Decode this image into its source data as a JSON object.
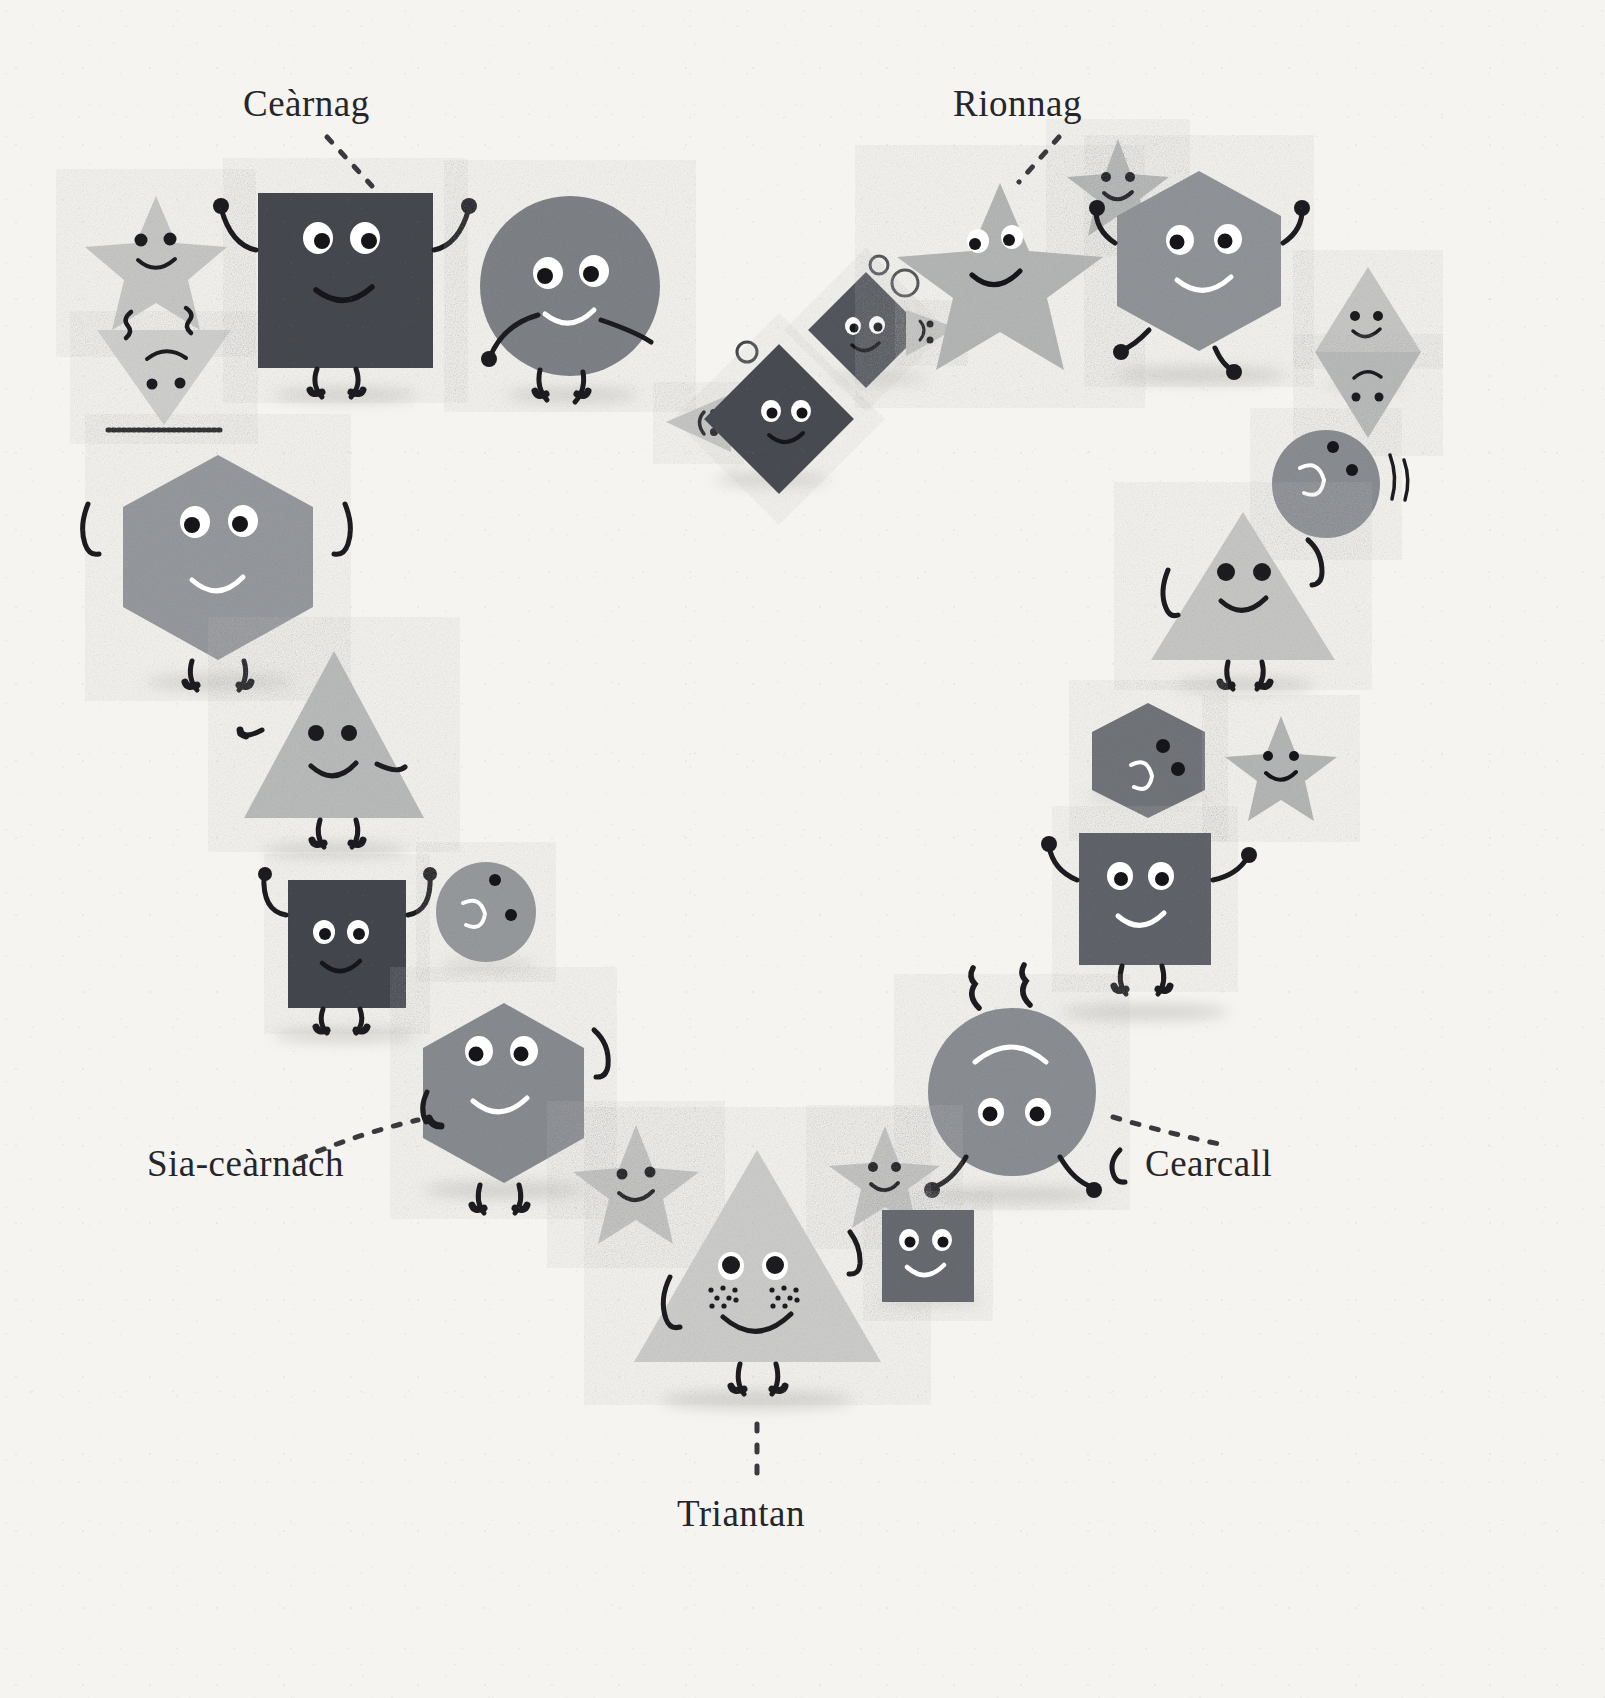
{
  "page": {
    "background_color": "#f5f4f0",
    "language": "Scottish Gaelic"
  },
  "labels": [
    {
      "id": "cearnag",
      "text": "Ceàrnag",
      "meaning": "square",
      "x": 243,
      "y": 82,
      "leader": "dashed-diagonal"
    },
    {
      "id": "rionnag",
      "text": "Rionnag",
      "meaning": "star",
      "x": 953,
      "y": 82,
      "leader": "dashed-diagonal"
    },
    {
      "id": "sia",
      "text": "Sia-ceàrnach",
      "meaning": "hexagon",
      "x": 147,
      "y": 1142,
      "leader": "dashed-diagonal"
    },
    {
      "id": "cearcall",
      "text": "Cearcall",
      "meaning": "circle",
      "x": 1145,
      "y": 1142,
      "leader": "dashed-diagonal"
    },
    {
      "id": "triantan",
      "text": "Triantan",
      "meaning": "triangle",
      "x": 677,
      "y": 1492,
      "leader": "dashed-vertical"
    }
  ],
  "palette": {
    "paper": "#f5f4f0",
    "charcoal": "#3f4147",
    "dark_slate": "#4a4d54",
    "mid_grey": "#8e9197",
    "grey": "#a2a5a9",
    "light_grey": "#bfc1c2",
    "pale_grey": "#d3d4d2",
    "ink": "#1c1c20",
    "eye_white": "#ffffff"
  },
  "characters": [
    {
      "name": "star-small-topleft",
      "shape": "star",
      "color": "#c9cac8",
      "expression": "smile"
    },
    {
      "name": "triangle-down-topleft",
      "shape": "triangle",
      "color": "#d2d3d1",
      "expression": "frown",
      "orientation": "down"
    },
    {
      "name": "square-cearnag",
      "shape": "square",
      "color": "#474a51",
      "expression": "smile",
      "arms": true,
      "legs": true
    },
    {
      "name": "circle-top",
      "shape": "circle",
      "color": "#808389",
      "expression": "smile",
      "arms": true,
      "legs": true
    },
    {
      "name": "triangle-left-bubbles",
      "shape": "triangle",
      "color": "#c9cac8",
      "expression": "smile",
      "orientation": "left"
    },
    {
      "name": "diamond-lower",
      "shape": "square",
      "color": "#4a4d54",
      "expression": "smile",
      "orientation": "rotated-45"
    },
    {
      "name": "diamond-upper",
      "shape": "square",
      "color": "#55585f",
      "expression": "smile",
      "orientation": "rotated-45"
    },
    {
      "name": "triangle-right-small",
      "shape": "triangle",
      "color": "#c9cac8",
      "expression": "smile",
      "orientation": "right"
    },
    {
      "name": "bubbles",
      "shape": "circles-outline",
      "color": "#44464b",
      "count": 6
    },
    {
      "name": "star-big-rionnag",
      "shape": "star",
      "color": "#b7b9b8",
      "expression": "smile"
    },
    {
      "name": "star-small-rionnag",
      "shape": "star",
      "color": "#b7b9b8",
      "expression": "smile"
    },
    {
      "name": "hexagon-topright",
      "shape": "hexagon",
      "color": "#93969a",
      "expression": "smile",
      "arms": true,
      "legs": true
    },
    {
      "name": "triangle-up-right-pair",
      "shape": "triangle",
      "color": "#c9cac8",
      "expression": "smile",
      "orientation": "up"
    },
    {
      "name": "triangle-down-right-pair",
      "shape": "triangle",
      "color": "#bbbdbc",
      "expression": "frown",
      "orientation": "down"
    },
    {
      "name": "circle-small-right",
      "shape": "circle",
      "color": "#8c8f94",
      "expression": "sideways"
    },
    {
      "name": "hexagon-left-big",
      "shape": "hexagon",
      "color": "#989b9f",
      "expression": "smile",
      "arms": true,
      "legs": true
    },
    {
      "name": "triangle-big-right",
      "shape": "triangle",
      "color": "#c9cac8",
      "expression": "smile",
      "arms": true,
      "legs": true
    },
    {
      "name": "triangle-left-mid",
      "shape": "triangle",
      "color": "#bcbebd",
      "expression": "smile",
      "arms": true,
      "legs": true
    },
    {
      "name": "hexagon-small-right",
      "shape": "hexagon",
      "color": "#73767c",
      "expression": "sideways"
    },
    {
      "name": "star-right-mid",
      "shape": "star",
      "color": "#b7b9b8",
      "expression": "smile"
    },
    {
      "name": "square-left-mid",
      "shape": "square",
      "color": "#45484f",
      "expression": "smile",
      "arms": true,
      "legs": true
    },
    {
      "name": "circle-small-left",
      "shape": "circle",
      "color": "#999c9f",
      "expression": "sideways"
    },
    {
      "name": "square-right-big",
      "shape": "square",
      "color": "#62656b",
      "expression": "smile",
      "arms": true,
      "legs": true
    },
    {
      "name": "hexagon-sia-cearnach",
      "shape": "hexagon",
      "color": "#8a8d92",
      "expression": "smile",
      "arms": true,
      "legs": true
    },
    {
      "name": "circle-cearcall",
      "shape": "circle",
      "color": "#8d9095",
      "expression": "upside-down",
      "arms": true,
      "legs": true
    },
    {
      "name": "star-bottom-left",
      "shape": "star",
      "color": "#c5c6c4",
      "expression": "smile"
    },
    {
      "name": "star-bottom-right",
      "shape": "star",
      "color": "#c5c6c4",
      "expression": "smile"
    },
    {
      "name": "triangle-triantan",
      "shape": "triangle",
      "color": "#cfd0ce",
      "expression": "smile-freckles",
      "arms": true,
      "legs": true
    },
    {
      "name": "square-bottom-small",
      "shape": "square",
      "color": "#696c72",
      "expression": "smile"
    }
  ]
}
